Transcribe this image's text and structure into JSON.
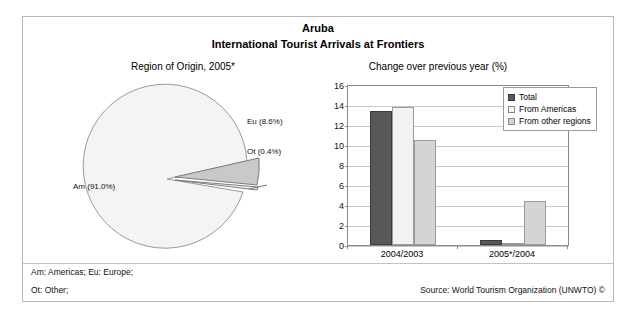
{
  "header": {
    "title": "Aruba",
    "subtitle": "International Tourist Arrivals at Frontiers"
  },
  "pie_panel": {
    "caption": "Region of Origin, 2005*"
  },
  "bar_panel": {
    "caption": "Change over previous year (%)"
  },
  "footer": {
    "key_line1": "Am: Americas; Eu: Europe;",
    "key_line2": "Ot: Other;",
    "source": "Source: World Tourism Organization (UNWTO) ©"
  },
  "chart_data": [
    {
      "type": "pie",
      "title": "Region of Origin, 2005*",
      "labels": [
        "Am (91.0%)",
        "Eu (8.6%)",
        "Ot (0.4%)"
      ],
      "categories": [
        "Am",
        "Eu",
        "Ot"
      ],
      "values": [
        91.0,
        8.6,
        0.4
      ],
      "colors": [
        "#f4f4f4",
        "#c9c9c9",
        "#e8e8e8"
      ],
      "legend": "none",
      "note": "Am: Americas; Eu: Europe; Ot: Other"
    },
    {
      "type": "bar",
      "title": "Change over previous year (%)",
      "categories": [
        "2004/2003",
        "2005*/2004"
      ],
      "series": [
        {
          "name": "Total",
          "values": [
            13.4,
            0.5
          ],
          "color": "#585858"
        },
        {
          "name": "From Americas",
          "values": [
            13.8,
            0.1
          ],
          "color": "#f2f2f2"
        },
        {
          "name": "From other regions",
          "values": [
            10.5,
            4.4
          ],
          "color": "#d4d4d4"
        }
      ],
      "xlabel": "",
      "ylabel": "",
      "ylim": [
        0,
        16
      ],
      "yticks": [
        0,
        2,
        4,
        6,
        8,
        10,
        12,
        14,
        16
      ],
      "grid": true,
      "legend_position": "top-right"
    }
  ]
}
